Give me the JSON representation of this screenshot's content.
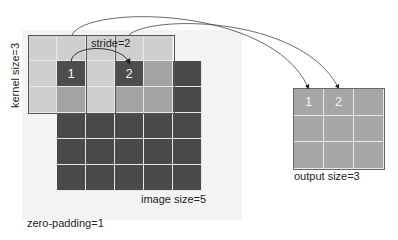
{
  "labels": {
    "kernel_size": "kernel size=3",
    "stride": "stride=2",
    "image_size": "image size=5",
    "output_size": "output size=3",
    "zero_padding": "zero-padding=1"
  },
  "input": {
    "cell_markers": [
      "1",
      "2"
    ]
  },
  "output": {
    "cell_markers": [
      "1",
      "2"
    ]
  },
  "colors": {
    "image_cell": "#4a4a4a",
    "padding_cell": "#cfcfcf",
    "overlap_cell": "#a3a3a3",
    "output_cell": "#a6a6a6",
    "grid_line": "#e8e8e8"
  }
}
